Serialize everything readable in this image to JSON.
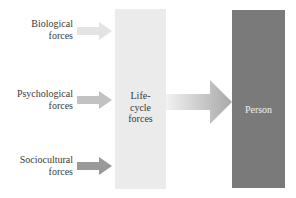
{
  "diagram": {
    "inputs": [
      {
        "id": "biological",
        "line1": "Biological",
        "line2": "forces",
        "arrow_color": "#e3e3e3"
      },
      {
        "id": "psychological",
        "line1": "Psychological",
        "line2": "forces",
        "arrow_color": "#c2c2c2"
      },
      {
        "id": "sociocultural",
        "line1": "Sociocultural",
        "line2": "forces",
        "arrow_color": "#999999"
      }
    ],
    "middle": {
      "line1": "Life-",
      "line2": "cycle",
      "line3": "forces",
      "color": "#ebebeb"
    },
    "output": {
      "label": "Person",
      "color": "#7a7a7a"
    },
    "main_arrow": {
      "gradient_start": "#f2f2f2",
      "gradient_end": "#a8a8a8"
    }
  }
}
